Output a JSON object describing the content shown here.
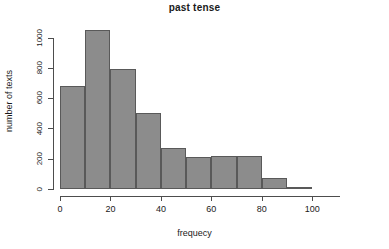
{
  "chart_data": {
    "type": "bar",
    "title": "past tense",
    "xlabel": "frequecy",
    "ylabel": "number of texts",
    "categories": [
      "0-10",
      "10-20",
      "20-30",
      "30-40",
      "40-50",
      "50-60",
      "60-70",
      "70-80",
      "80-90",
      "90-100"
    ],
    "bin_edges": [
      0,
      10,
      20,
      30,
      40,
      50,
      60,
      70,
      80,
      90,
      100
    ],
    "values": [
      680,
      1050,
      790,
      500,
      270,
      210,
      218,
      215,
      75,
      10
    ],
    "xlim": [
      0,
      111
    ],
    "ylim": [
      0,
      1050
    ],
    "xticks": [
      0,
      20,
      40,
      60,
      80,
      100
    ],
    "xtick_labels": [
      "0",
      "20",
      "40",
      "60",
      "80",
      "100"
    ],
    "yticks": [
      0,
      200,
      400,
      600,
      800,
      1000
    ],
    "ytick_labels": [
      "0",
      "200",
      "400",
      "600",
      "800",
      "1000"
    ],
    "grid": false,
    "legend": false,
    "bar_fill_color": "#8c8c8c",
    "bar_border_color": "#595959",
    "axis_color": "#4d4d4d",
    "background_color": "#ffffff"
  }
}
